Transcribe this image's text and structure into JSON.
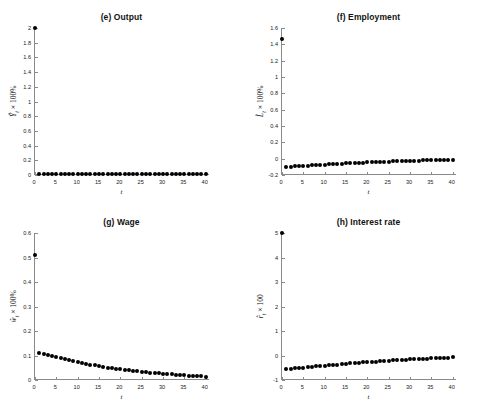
{
  "figure": {
    "width": 483,
    "height": 413,
    "background": "#ffffff",
    "marker_color": "#000000",
    "axis_color": "#8a8a8a",
    "layout": "2x2 grid of impulse response subplots"
  },
  "chart_data": [
    {
      "type": "scatter",
      "panel": "e",
      "title": "(e) Output",
      "xlabel": "t",
      "ylabel": "Ŷ_t × 100%",
      "ylabel_parts": {
        "variable": "Ŷ",
        "subscript": "t",
        "suffix": " × 100%"
      },
      "xlim": [
        0,
        41
      ],
      "ylim": [
        0,
        2
      ],
      "xticks": [
        0,
        5,
        10,
        15,
        20,
        25,
        30,
        35,
        40
      ],
      "xticklabels": [
        "0",
        "5",
        "10",
        "15",
        "20",
        "25",
        "30",
        "35",
        "40"
      ],
      "yticks": [
        0,
        0.2,
        0.4,
        0.6,
        0.8,
        1,
        1.2,
        1.4,
        1.6,
        1.8,
        2
      ],
      "yticklabels": [
        "0",
        "0.2",
        "0.4",
        "0.6",
        "0.8",
        "1",
        "1.2",
        "1.4",
        "1.6",
        "1.8",
        "2"
      ],
      "grid": false,
      "legend": "none",
      "x": [
        0,
        1,
        2,
        3,
        4,
        5,
        6,
        7,
        8,
        9,
        10,
        11,
        12,
        13,
        14,
        15,
        16,
        17,
        18,
        19,
        20,
        21,
        22,
        23,
        24,
        25,
        26,
        27,
        28,
        29,
        30,
        31,
        32,
        33,
        34,
        35,
        36,
        37,
        38,
        39,
        40
      ],
      "values": [
        2.0,
        0.02,
        0.02,
        0.02,
        0.02,
        0.02,
        0.02,
        0.02,
        0.02,
        0.02,
        0.02,
        0.02,
        0.02,
        0.02,
        0.02,
        0.02,
        0.02,
        0.02,
        0.02,
        0.02,
        0.02,
        0.02,
        0.02,
        0.02,
        0.02,
        0.02,
        0.02,
        0.02,
        0.02,
        0.02,
        0.02,
        0.02,
        0.02,
        0.02,
        0.02,
        0.02,
        0.02,
        0.02,
        0.02,
        0.02,
        0.02
      ]
    },
    {
      "type": "scatter",
      "panel": "f",
      "title": "(f) Employment",
      "xlabel": "t",
      "ylabel": "L̂_t × 100%",
      "ylabel_parts": {
        "variable": "L̂",
        "subscript": "t",
        "suffix": " × 100%"
      },
      "xlim": [
        0,
        41
      ],
      "ylim": [
        -0.2,
        1.6
      ],
      "xticks": [
        0,
        5,
        10,
        15,
        20,
        25,
        30,
        35,
        40
      ],
      "xticklabels": [
        "0",
        "5",
        "10",
        "15",
        "20",
        "25",
        "30",
        "35",
        "40"
      ],
      "yticks": [
        -0.2,
        0,
        0.2,
        0.4,
        0.6,
        0.8,
        1,
        1.2,
        1.4,
        1.6
      ],
      "yticklabels": [
        "-0.2",
        "0",
        "0.2",
        "0.4",
        "0.6",
        "0.8",
        "1",
        "1.2",
        "1.4",
        "1.6"
      ],
      "grid": false,
      "legend": "none",
      "x": [
        0,
        1,
        2,
        3,
        4,
        5,
        6,
        7,
        8,
        9,
        10,
        11,
        12,
        13,
        14,
        15,
        16,
        17,
        18,
        19,
        20,
        21,
        22,
        23,
        24,
        25,
        26,
        27,
        28,
        29,
        30,
        31,
        32,
        33,
        34,
        35,
        36,
        37,
        38,
        39,
        40
      ],
      "values": [
        1.47,
        -0.098,
        -0.096,
        -0.094,
        -0.092,
        -0.089,
        -0.086,
        -0.083,
        -0.08,
        -0.077,
        -0.074,
        -0.071,
        -0.068,
        -0.065,
        -0.062,
        -0.059,
        -0.056,
        -0.054,
        -0.051,
        -0.049,
        -0.046,
        -0.044,
        -0.042,
        -0.04,
        -0.038,
        -0.036,
        -0.034,
        -0.032,
        -0.03,
        -0.029,
        -0.027,
        -0.025,
        -0.024,
        -0.022,
        -0.021,
        -0.02,
        -0.018,
        -0.017,
        -0.016,
        -0.015,
        -0.014
      ]
    },
    {
      "type": "scatter",
      "panel": "g",
      "title": "(g) Wage",
      "xlabel": "t",
      "ylabel": "ŵ_t × 100%",
      "ylabel_parts": {
        "variable": "ŵ",
        "subscript": "t",
        "suffix": " × 100%"
      },
      "xlim": [
        0,
        41
      ],
      "ylim": [
        0,
        0.6
      ],
      "xticks": [
        0,
        5,
        10,
        15,
        20,
        25,
        30,
        35,
        40
      ],
      "xticklabels": [
        "0",
        "5",
        "10",
        "15",
        "20",
        "25",
        "30",
        "35",
        "40"
      ],
      "yticks": [
        0,
        0.1,
        0.2,
        0.3,
        0.4,
        0.5,
        0.6
      ],
      "yticklabels": [
        "0",
        "0.1",
        "0.2",
        "0.3",
        "0.4",
        "0.5",
        "0.6"
      ],
      "grid": false,
      "legend": "none",
      "x": [
        0,
        1,
        2,
        3,
        4,
        5,
        6,
        7,
        8,
        9,
        10,
        11,
        12,
        13,
        14,
        15,
        16,
        17,
        18,
        19,
        20,
        21,
        22,
        23,
        24,
        25,
        26,
        27,
        28,
        29,
        30,
        31,
        32,
        33,
        34,
        35,
        36,
        37,
        38,
        39,
        40
      ],
      "values": [
        0.51,
        0.11,
        0.106,
        0.102,
        0.098,
        0.094,
        0.09,
        0.086,
        0.082,
        0.078,
        0.074,
        0.07,
        0.066,
        0.063,
        0.06,
        0.057,
        0.054,
        0.051,
        0.048,
        0.046,
        0.044,
        0.042,
        0.04,
        0.038,
        0.036,
        0.034,
        0.032,
        0.03,
        0.029,
        0.027,
        0.026,
        0.024,
        0.023,
        0.022,
        0.02,
        0.019,
        0.018,
        0.017,
        0.016,
        0.015,
        0.014
      ]
    },
    {
      "type": "scatter",
      "panel": "h",
      "title": "(h) Interest rate",
      "xlabel": "t",
      "ylabel": "r̂_t × 100",
      "ylabel_parts": {
        "variable": "r̂",
        "subscript": "t",
        "suffix": " × 100"
      },
      "xlim": [
        0,
        41
      ],
      "ylim": [
        -1,
        5
      ],
      "xticks": [
        0,
        5,
        10,
        15,
        20,
        25,
        30,
        35,
        40
      ],
      "xticklabels": [
        "0",
        "5",
        "10",
        "15",
        "20",
        "25",
        "30",
        "35",
        "40"
      ],
      "yticks": [
        -1,
        0,
        1,
        2,
        3,
        4,
        5
      ],
      "yticklabels": [
        "-1",
        "0",
        "1",
        "2",
        "3",
        "4",
        "5"
      ],
      "grid": false,
      "legend": "none",
      "x": [
        0,
        1,
        2,
        3,
        4,
        5,
        6,
        7,
        8,
        9,
        10,
        11,
        12,
        13,
        14,
        15,
        16,
        17,
        18,
        19,
        20,
        21,
        22,
        23,
        24,
        25,
        26,
        27,
        28,
        29,
        30,
        31,
        32,
        33,
        34,
        35,
        36,
        37,
        38,
        39,
        40
      ],
      "values": [
        5.0,
        -0.55,
        -0.535,
        -0.52,
        -0.505,
        -0.49,
        -0.475,
        -0.46,
        -0.445,
        -0.43,
        -0.415,
        -0.4,
        -0.385,
        -0.37,
        -0.355,
        -0.34,
        -0.325,
        -0.31,
        -0.295,
        -0.283,
        -0.27,
        -0.258,
        -0.245,
        -0.233,
        -0.222,
        -0.21,
        -0.2,
        -0.19,
        -0.18,
        -0.17,
        -0.16,
        -0.15,
        -0.14,
        -0.132,
        -0.124,
        -0.116,
        -0.108,
        -0.1,
        -0.093,
        -0.086,
        -0.08
      ]
    }
  ]
}
